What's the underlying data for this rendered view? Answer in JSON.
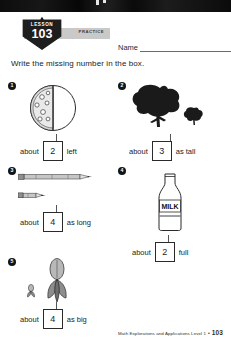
{
  "header": {
    "lesson_word": "LESSON",
    "lesson_number": "103",
    "practice_label": "PRACTICE",
    "name_label": "Name"
  },
  "directions": "Write the missing number in the box.",
  "problems": [
    {
      "number": "1",
      "art": "pizza-half-topped",
      "prefix": "about",
      "answer": "2",
      "suffix": "left"
    },
    {
      "number": "2",
      "art": "tree-large-and-small",
      "prefix": "about",
      "answer": "3",
      "suffix": "as tall"
    },
    {
      "number": "3",
      "art": "pencil-long-and-short",
      "prefix": "about",
      "answer": "4",
      "suffix": "as long"
    },
    {
      "number": "4",
      "art": "milk-bottle",
      "label_on_art": "MILK",
      "prefix": "about",
      "answer": "2",
      "suffix": "full"
    },
    {
      "number": "5",
      "art": "leaf-large-and-small",
      "prefix": "about",
      "answer": "4",
      "suffix": "as big"
    }
  ],
  "footer": {
    "source": "Math Explorations and Applications Level 1",
    "separator": "•",
    "page": "103"
  },
  "colors": {
    "ink": "#1c1c1c",
    "badge": "#1e1e1e",
    "practice_bar": "#c9c9c9",
    "rule": "#6a6a6a"
  }
}
